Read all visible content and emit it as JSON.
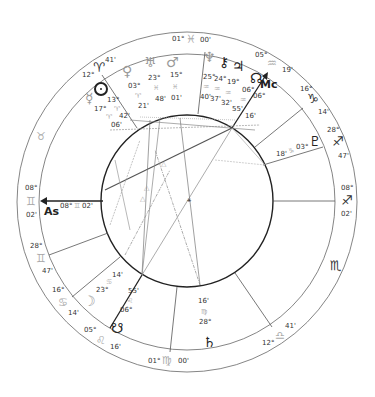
{
  "chart": {
    "angles": {
      "asc_label": "As",
      "mc_label": "Mc",
      "asc_degree": "08°",
      "asc_sign": "♊",
      "asc_minute": "02'"
    },
    "zodiac_labels": [
      {
        "deg": "01°",
        "sign": "♓",
        "min": "00'"
      },
      {
        "deg": "05°",
        "sign": "♒",
        "min": "19'"
      },
      {
        "deg": "16°",
        "sign": "♑",
        "min": "14'"
      },
      {
        "deg": "28°",
        "sign": "♐",
        "min": "47'"
      },
      {
        "deg": "08°",
        "sign": "♐",
        "min": "02'"
      },
      {
        "sign_only": "♏"
      },
      {
        "deg": "12°",
        "sign": "♎",
        "min": "41'"
      },
      {
        "deg": "01°",
        "sign": "♍",
        "min": "00'"
      },
      {
        "deg": "05°",
        "sign": "♌",
        "min": "16'"
      },
      {
        "deg": "16°",
        "sign": "♋",
        "min": "14'"
      },
      {
        "deg": "28°",
        "sign": "♊",
        "min": "47'"
      },
      {
        "deg": "08°",
        "sign": "♊",
        "min": "02'"
      },
      {
        "sign_only": "♉"
      },
      {
        "deg": "12°",
        "sign": "♈",
        "min": "41'"
      }
    ],
    "planets": [
      {
        "name": "Sun",
        "glyph": "☉",
        "deg": "13°",
        "sign": "♈",
        "min": "42'"
      },
      {
        "name": "Mercury",
        "glyph": "☿",
        "deg": "17°",
        "sign": "♈",
        "min": "06'"
      },
      {
        "name": "Venus",
        "glyph": "♀",
        "deg": "03°",
        "sign": "♈",
        "min": "21'"
      },
      {
        "name": "Uranus",
        "glyph": "♅",
        "deg": "23°",
        "sign": "♓",
        "min": "48'"
      },
      {
        "name": "Mars",
        "glyph": "♂",
        "deg": "15°",
        "sign": "♓",
        "min": "01'"
      },
      {
        "name": "Neptune",
        "glyph": "♆",
        "deg": "25°",
        "sign": "♒",
        "min": "40'"
      },
      {
        "name": "Chiron",
        "glyph": "⚷",
        "deg": "24°",
        "sign": "♒",
        "min": "37'"
      },
      {
        "name": "Jupiter",
        "glyph": "♃",
        "deg": "19°",
        "sign": "♒",
        "min": "32'"
      },
      {
        "name": "North Node",
        "glyph": "☊",
        "deg": "06°",
        "sign": "♒",
        "min": "55'"
      },
      {
        "name": "Pluto",
        "glyph": "♇",
        "deg": "03°",
        "sign": "♑",
        "min": "18'"
      },
      {
        "name": "Saturn",
        "glyph": "♄",
        "deg": "28°",
        "sign": "♍",
        "min": "16'"
      },
      {
        "name": "Moon",
        "glyph": "☽",
        "deg": "23°",
        "sign": "♋",
        "min": "14'"
      },
      {
        "name": "South Node",
        "glyph": "☋",
        "deg": "06°",
        "sign": "♌",
        "min": "55'"
      }
    ],
    "mc": {
      "deg": "06°",
      "min": "16'"
    }
  }
}
